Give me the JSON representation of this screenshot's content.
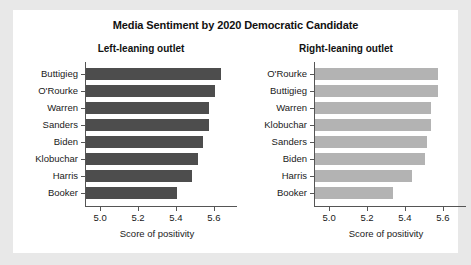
{
  "chart_data": {
    "type": "bar",
    "title": "Media Sentiment by 2020 Democratic Candidate",
    "xlabel": "Score of positivity",
    "ylabel": "",
    "xlim": [
      4.92,
      5.68
    ],
    "xticks": [
      "5.0",
      "5.2",
      "5.4",
      "5.6"
    ],
    "xtick_values": [
      5.0,
      5.2,
      5.4,
      5.6
    ],
    "grid": false,
    "legend": "none",
    "orientation": "horizontal",
    "panels": [
      {
        "subtitle": "Left-leaning outlet",
        "color": "#4d4d4d",
        "categories": [
          "Buttigieg",
          "O'Rourke",
          "Warren",
          "Sanders",
          "Biden",
          "Klobuchar",
          "Harris",
          "Booker"
        ],
        "values": [
          5.63,
          5.6,
          5.57,
          5.57,
          5.54,
          5.51,
          5.48,
          5.4
        ],
        "xlabel": "Score of positivity"
      },
      {
        "subtitle": "Right-leaning outlet",
        "color": "#b3b3b3",
        "categories": [
          "O'Rourke",
          "Buttigieg",
          "Warren",
          "Klobuchar",
          "Sanders",
          "Biden",
          "Harris",
          "Booker"
        ],
        "values": [
          5.57,
          5.57,
          5.53,
          5.53,
          5.51,
          5.5,
          5.43,
          5.33
        ],
        "xlabel": "Score of positivity"
      }
    ]
  },
  "colors": {
    "page_background": "#e8e8e8",
    "panel_background": "#ffffff",
    "axis": "#555555",
    "text": "#111111",
    "bar_left": "#4d4d4d",
    "bar_right": "#b3b3b3"
  }
}
